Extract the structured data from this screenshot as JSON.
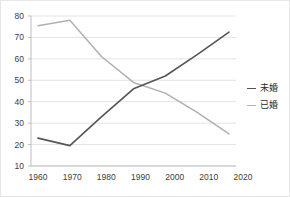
{
  "chart_data": {
    "type": "line",
    "title": "",
    "subtitle": "",
    "xlabel": "",
    "ylabel": "",
    "x": [
      1960,
      1970,
      1980,
      1990,
      2000,
      2010,
      2020
    ],
    "xtick_labels": [
      "1960",
      "1970",
      "1980",
      "1990",
      "2000",
      "2010",
      "2020"
    ],
    "ytick_labels": [
      "10",
      "20",
      "30",
      "40",
      "50",
      "60",
      "70",
      "80"
    ],
    "ylim": [
      10,
      80
    ],
    "xlim": [
      1960,
      2020
    ],
    "grid": "horizontal",
    "legend_position": "right",
    "series": [
      {
        "name": "未婚",
        "color": "#555555",
        "values": [
          23,
          19.5,
          33,
          46,
          52,
          62,
          72.5
        ]
      },
      {
        "name": "已婚",
        "color": "#b0b0b0",
        "values": [
          75.5,
          78,
          61,
          49,
          44,
          35,
          25
        ]
      }
    ]
  },
  "axes": {
    "y_ticks": [
      {
        "label": "80",
        "value": 80
      },
      {
        "label": "70",
        "value": 70
      },
      {
        "label": "60",
        "value": 60
      },
      {
        "label": "50",
        "value": 50
      },
      {
        "label": "40",
        "value": 40
      },
      {
        "label": "30",
        "value": 30
      },
      {
        "label": "20",
        "value": 20
      },
      {
        "label": "10",
        "value": 10
      }
    ],
    "x_ticks": [
      {
        "label": "1960",
        "value": 1960
      },
      {
        "label": "1970",
        "value": 1970
      },
      {
        "label": "1980",
        "value": 1980
      },
      {
        "label": "1990",
        "value": 1990
      },
      {
        "label": "2000",
        "value": 2000
      },
      {
        "label": "2010",
        "value": 2010
      },
      {
        "label": "2020",
        "value": 2020
      }
    ]
  },
  "legend": {
    "items": [
      {
        "label": "未婚",
        "color": "#555555"
      },
      {
        "label": "已婚",
        "color": "#b0b0b0"
      }
    ]
  },
  "colors": {
    "unmarried_line": "#555555",
    "married_line": "#b0b0b0",
    "gridline": "#e3e3e3",
    "axis": "#bfbfbf",
    "tick_text": "#404040",
    "background": "#ffffff",
    "border": "#e6e6e6"
  }
}
